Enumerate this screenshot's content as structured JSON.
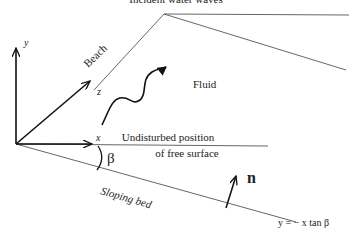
{
  "title_cutoff": "Incident water waves",
  "axes": {
    "x": "x",
    "y": "y",
    "z": "z"
  },
  "labels": {
    "beach": "Beach",
    "fluid": "Fluid",
    "surface_line1": "Undisturbed position",
    "surface_line2": "of free surface",
    "angle": "β",
    "normal": "n",
    "bed": "Sloping bed",
    "bed_equation": "y = − x  tan β"
  }
}
